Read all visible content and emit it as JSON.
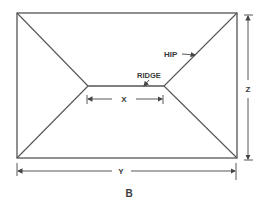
{
  "diagram": {
    "caption": "B",
    "labels": {
      "hip": "HIP",
      "ridge": "RIDGE",
      "x": "X",
      "y": "Y",
      "z": "Z"
    },
    "colors": {
      "line": "#555555",
      "text": "#3a3a3a",
      "background": "#ffffff"
    }
  }
}
